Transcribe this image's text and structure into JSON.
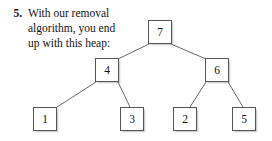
{
  "exercise": {
    "number": "5.",
    "lines": [
      "With our removal",
      "algorithm, you end",
      "up with this heap:"
    ]
  },
  "diagram": {
    "type": "binary-heap-tree",
    "node_border_color": "#555555",
    "node_fill_color": "#ffffff",
    "edge_color": "#555555",
    "nodes": [
      {
        "id": "root",
        "value": "7",
        "x": 148,
        "y": 20,
        "level": 0
      },
      {
        "id": "left",
        "value": "4",
        "x": 95,
        "y": 58,
        "level": 1
      },
      {
        "id": "right",
        "value": "6",
        "x": 205,
        "y": 58,
        "level": 1
      },
      {
        "id": "leaf1",
        "value": "1",
        "x": 33,
        "y": 107,
        "level": 2
      },
      {
        "id": "leaf2",
        "value": "3",
        "x": 120,
        "y": 107,
        "level": 2
      },
      {
        "id": "leaf3",
        "value": "2",
        "x": 173,
        "y": 107,
        "level": 2
      },
      {
        "id": "leaf4",
        "value": "5",
        "x": 232,
        "y": 107,
        "level": 2
      }
    ],
    "edges": [
      {
        "from": "root",
        "to": "left",
        "x1": 149,
        "y1": 44,
        "x2": 118,
        "y2": 59
      },
      {
        "from": "root",
        "to": "right",
        "x1": 171,
        "y1": 44,
        "x2": 206,
        "y2": 59
      },
      {
        "from": "left",
        "to": "leaf1",
        "x1": 96,
        "y1": 82,
        "x2": 57,
        "y2": 107
      },
      {
        "from": "left",
        "to": "leaf2",
        "x1": 118,
        "y1": 82,
        "x2": 130,
        "y2": 107
      },
      {
        "from": "right",
        "to": "leaf3",
        "x1": 206,
        "y1": 82,
        "x2": 190,
        "y2": 107
      },
      {
        "from": "right",
        "to": "leaf4",
        "x1": 228,
        "y1": 82,
        "x2": 243,
        "y2": 107
      }
    ]
  }
}
